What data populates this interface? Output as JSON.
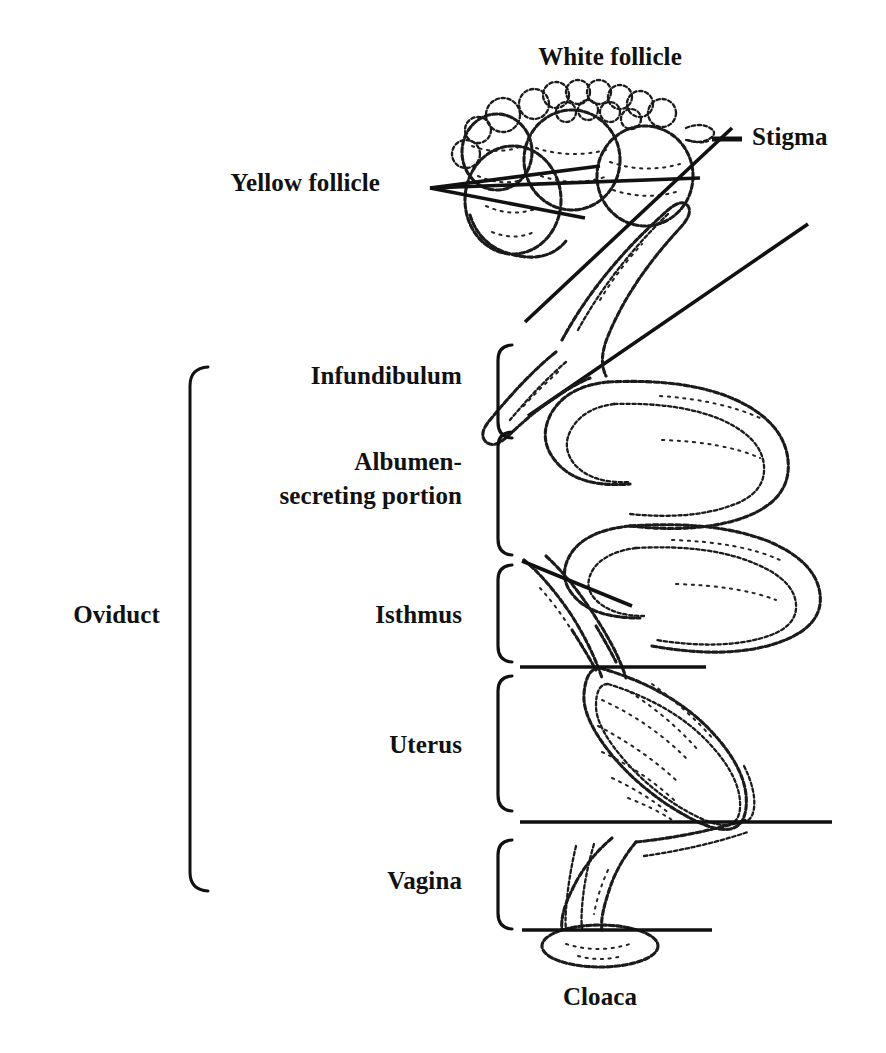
{
  "figure": {
    "ink_color": "#111111",
    "background_color": "#ffffff"
  },
  "labels": {
    "white_follicle": "White follicle",
    "stigma": "Stigma",
    "yellow_follicle": "Yellow follicle",
    "infundibulum": "Infundibulum",
    "albumen_line1": "Albumen-",
    "albumen_line2": "secreting portion",
    "isthmus": "Isthmus",
    "uterus": "Uterus",
    "vagina": "Vagina",
    "oviduct": "Oviduct",
    "cloaca": "Cloaca"
  },
  "structure": {
    "oviduct_segments": [
      "Infundibulum",
      "Albumen-secreting portion",
      "Isthmus",
      "Uterus",
      "Vagina"
    ],
    "ovary_parts": [
      "White follicle",
      "Yellow follicle",
      "Stigma"
    ],
    "terminal_part": "Cloaca",
    "bracket_count": 5,
    "divider_line_count": 3,
    "leader_line_count": 6
  },
  "icons": {
    "stigma_dash": "dash-leader-icon",
    "follicle_leaders": "fan-leader-icon",
    "segment_bracket": "curly-bracket-icon",
    "oviduct_bracket": "tall-bracket-icon"
  }
}
